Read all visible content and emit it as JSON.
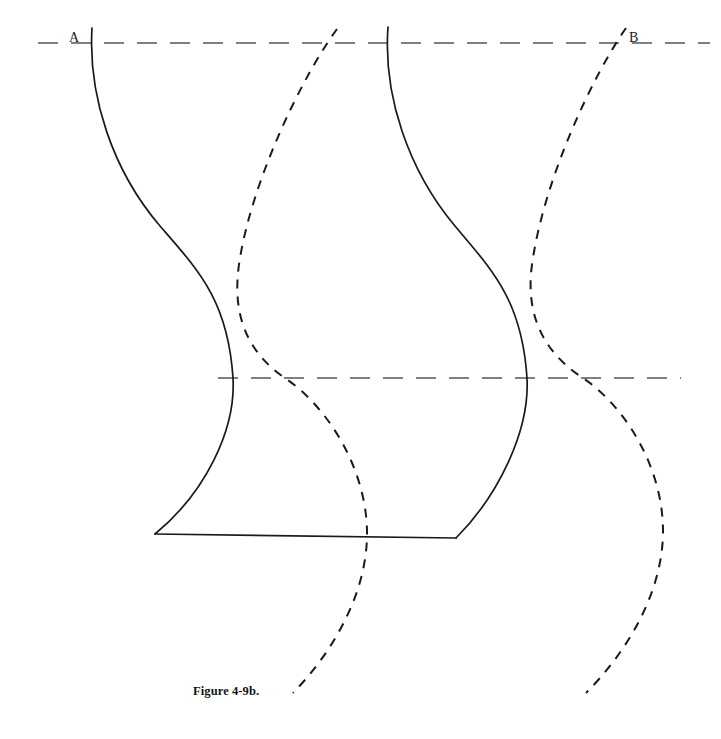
{
  "figure": {
    "caption": "Figure 4-9b.",
    "background_color": "#ffffff",
    "solid_curve_color": "#1a1a1a",
    "dashed_curve_color": "#1a1a1a",
    "guide_line_color": "#808080",
    "labels": [
      {
        "id": "A",
        "text": "A",
        "x": 75,
        "y": 38
      },
      {
        "id": "B",
        "text": "B",
        "x": 635,
        "y": 38
      }
    ],
    "guide_lines": [
      {
        "name": "top-datum-line",
        "y": 43,
        "x_start": 38,
        "x_end": 710,
        "style": "dashed"
      },
      {
        "name": "middle-datum-line",
        "y": 378,
        "x_start": 218,
        "x_end": 681,
        "style": "dashed"
      }
    ],
    "base_line": {
      "name": "base-line",
      "x_start": 155,
      "y_start": 534,
      "x_end": 456,
      "y_end": 538,
      "style": "solid"
    },
    "solid_curves": [
      {
        "name": "left-solid-curve",
        "path": "M 92,28 C 88,95 112,170 160,226 C 198,270 228,300 233,378 C 236,430 205,493 155,534"
      },
      {
        "name": "right-solid-curve",
        "path": "M 388,27 C 383,95 408,170 455,226 C 492,270 522,300 527,378 C 530,432 497,497 456,538"
      }
    ],
    "dashed_curves": [
      {
        "name": "left-dashed-curve",
        "path": "M 337,29 C 300,80 253,180 240,258 C 231,310 244,350 285,378 C 330,409 366,470 367,531 C 368,595 330,655 293,693"
      },
      {
        "name": "right-dashed-curve",
        "path": "M 626,28 C 590,80 545,180 533,258 C 524,310 540,350 583,378 C 628,409 663,470 663,531 C 663,595 624,655 586,693"
      }
    ]
  }
}
